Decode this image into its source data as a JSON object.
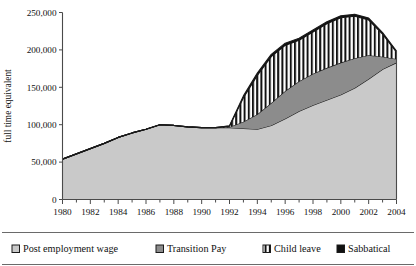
{
  "chart_data": {
    "type": "area",
    "stacked": true,
    "title": "",
    "xlabel": "",
    "ylabel": "full time equivalent",
    "xlim": [
      1980,
      2004
    ],
    "ylim": [
      0,
      250000
    ],
    "ytick_labels": [
      "250,000",
      "200,000",
      "150,000",
      "100,000",
      "50,000",
      "0"
    ],
    "ytick_values": [
      250000,
      200000,
      150000,
      100000,
      50000,
      0
    ],
    "xtick_labels": [
      "1980",
      "1982",
      "1984",
      "1986",
      "1988",
      "1990",
      "1992",
      "1994",
      "1996",
      "1998",
      "2000",
      "2002",
      "2004"
    ],
    "xtick_values": [
      1980,
      1982,
      1984,
      1986,
      1988,
      1990,
      1992,
      1994,
      1996,
      1998,
      2000,
      2002,
      2004
    ],
    "minor_xticks_every": 1,
    "grid": false,
    "legend_position": "bottom",
    "x": [
      1980,
      1981,
      1982,
      1983,
      1984,
      1985,
      1986,
      1987,
      1988,
      1989,
      1990,
      1991,
      1992,
      1993,
      1994,
      1995,
      1996,
      1997,
      1998,
      1999,
      2000,
      2001,
      2002,
      2003,
      2004
    ],
    "series": [
      {
        "name": "Post employment wage",
        "fill": "#c9c9c9",
        "pattern": "solid",
        "values": [
          54000,
          61000,
          68000,
          75000,
          83000,
          89000,
          94000,
          100000,
          99000,
          97000,
          96000,
          96000,
          96000,
          95000,
          94000,
          99000,
          108000,
          118000,
          126000,
          133000,
          140000,
          149000,
          161000,
          174000,
          183000
        ]
      },
      {
        "name": "Transition Pay",
        "fill": "#8c8c8c",
        "pattern": "solid",
        "values": [
          0,
          0,
          0,
          0,
          0,
          0,
          0,
          0,
          0,
          0,
          0,
          0,
          1000,
          9000,
          20000,
          30000,
          37000,
          40000,
          42000,
          43000,
          43000,
          40000,
          32000,
          17000,
          5000
        ]
      },
      {
        "name": "Child leave",
        "fill": "#ffffff",
        "pattern": "vertical-stripes",
        "values": [
          0,
          0,
          0,
          0,
          0,
          0,
          0,
          0,
          0,
          0,
          0,
          0,
          1000,
          32000,
          52000,
          62000,
          61000,
          55000,
          56000,
          59000,
          60000,
          56000,
          47000,
          30000,
          9000
        ]
      },
      {
        "name": "Sabbatical",
        "fill": "#111111",
        "pattern": "solid",
        "values": [
          0,
          0,
          0,
          0,
          0,
          0,
          0,
          0,
          0,
          0,
          0,
          0,
          500,
          2500,
          3000,
          3000,
          3000,
          2500,
          2500,
          2500,
          2500,
          2500,
          2500,
          2000,
          1500
        ]
      }
    ]
  },
  "legend": {
    "items": [
      {
        "label": "Post employment wage",
        "swatch": "light-gray"
      },
      {
        "label": "Transition Pay",
        "swatch": "dark-gray"
      },
      {
        "label": "Child leave",
        "swatch": "striped"
      },
      {
        "label": "Sabbatical",
        "swatch": "black"
      }
    ]
  }
}
